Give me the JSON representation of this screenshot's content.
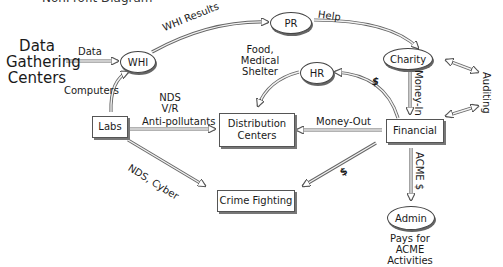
{
  "title": "NonProfit Diagram",
  "nodes": {
    "data_gathering": "Data\nGathering\nCenters",
    "whi": "WHI",
    "pr": "PR",
    "charity": "Charity",
    "hr": "HR",
    "labs": "Labs",
    "distribution": "Distribution\nCenters",
    "financial": "Financial",
    "crime": "Crime Fighting",
    "admin": "Admin"
  },
  "edges": {
    "data": "Data",
    "whi_results": "WHI Results",
    "help": "Help",
    "computers": "Computers",
    "food": "Food,\nMedical\nShelter",
    "nds_vr": "NDS\nV/R",
    "anti_pollutants": "Anti-pollutants",
    "money_out": "Money-Out",
    "money_in": "Money-In",
    "dollar_hr": "$",
    "auditing": "Auditing",
    "nds_cyber": "NDS, Cyber",
    "dollar_crime": "$",
    "acme": "ACME $"
  },
  "notes": {
    "admin_caption": "Pays for\nACME Activities"
  },
  "colors": {
    "arrow_fill": "#e8e8e8",
    "arrow_stroke": "#555555",
    "node_border": "#444444"
  }
}
